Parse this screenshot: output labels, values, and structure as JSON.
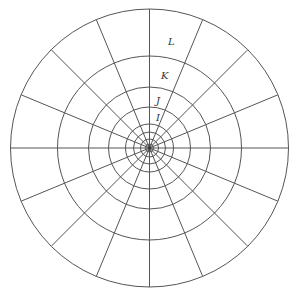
{
  "diagram": {
    "type": "polar-grid",
    "center": {
      "x": 149.5,
      "y": 148
    },
    "ring_radii": [
      139,
      92,
      61,
      41,
      24,
      16,
      9,
      4
    ],
    "spoke_count": 16,
    "spoke_step_degrees": 22.5,
    "stroke_color": "#555555",
    "labels": [
      {
        "id": "L",
        "text": "L",
        "x": 168,
        "y": 45
      },
      {
        "id": "K",
        "text": "K",
        "x": 161,
        "y": 79
      },
      {
        "id": "J",
        "text": "J",
        "x": 156,
        "y": 104
      },
      {
        "id": "I",
        "text": "I",
        "x": 156,
        "y": 121
      }
    ]
  }
}
